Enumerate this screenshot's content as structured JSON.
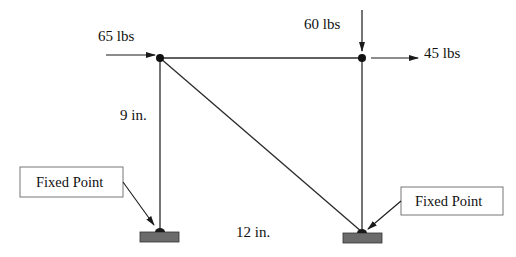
{
  "diagram": {
    "type": "truss-free-body",
    "colors": {
      "line": "#2a2a2a",
      "support_fill": "#6b6b6b",
      "support_stroke": "#333333",
      "box_stroke": "#777777",
      "text": "#111111"
    },
    "nodes": [
      {
        "id": "top-left",
        "x": 160,
        "y": 58
      },
      {
        "id": "top-right",
        "x": 362,
        "y": 58
      },
      {
        "id": "bottom-left",
        "x": 160,
        "y": 232
      },
      {
        "id": "bottom-right",
        "x": 362,
        "y": 232
      }
    ],
    "members": [
      {
        "from": "top-left",
        "to": "top-right"
      },
      {
        "from": "top-left",
        "to": "bottom-left"
      },
      {
        "from": "top-right",
        "to": "bottom-right"
      },
      {
        "from": "top-left",
        "to": "bottom-right"
      }
    ],
    "loads": {
      "left_horizontal": {
        "label": "65 lbs",
        "direction": "right",
        "node": "top-left"
      },
      "right_vertical": {
        "label": "60 lbs",
        "direction": "down",
        "node": "top-right"
      },
      "right_horizontal": {
        "label": "45 lbs",
        "direction": "right",
        "node": "top-right"
      }
    },
    "dimensions": {
      "height": "9 in.",
      "width": "12 in."
    },
    "supports": {
      "left": {
        "label": "Fixed Point"
      },
      "right": {
        "label": "Fixed Point"
      }
    }
  }
}
